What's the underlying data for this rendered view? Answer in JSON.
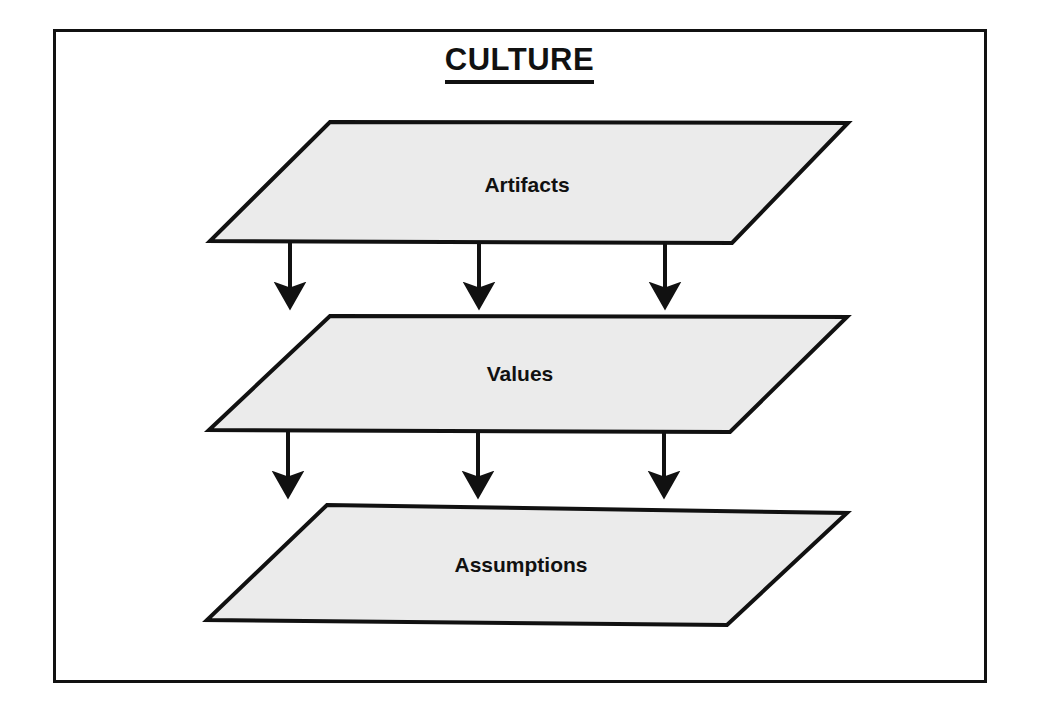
{
  "diagram": {
    "title": "CULTURE",
    "frame": {
      "border_color": "#111111",
      "background_color": "#ffffff"
    },
    "shape_style": {
      "fill_color": "#ebebeb",
      "stroke_color": "#111111",
      "shape": "parallelogram"
    },
    "layers": [
      {
        "label": "Artifacts",
        "order": 1,
        "label_x": 527,
        "label_y": 185,
        "points": "330,122 848,123 732,243 210,241"
      },
      {
        "label": "Values",
        "order": 2,
        "label_x": 520,
        "label_y": 374,
        "points": "330,316 847,317 730,432 209,430"
      },
      {
        "label": "Assumptions",
        "order": 3,
        "label_x": 521,
        "label_y": 565,
        "points": "327,505 847,513 727,625 207,620"
      }
    ],
    "arrow_groups": [
      {
        "from_layer": "Artifacts",
        "to_layer": "Values",
        "direction": "down",
        "count": 3,
        "arrows": [
          {
            "x": 290,
            "y_start": 243,
            "y_end": 303
          },
          {
            "x": 479,
            "y_start": 243,
            "y_end": 303
          },
          {
            "x": 665,
            "y_start": 243,
            "y_end": 303
          }
        ]
      },
      {
        "from_layer": "Values",
        "to_layer": "Assumptions",
        "direction": "down",
        "count": 3,
        "arrows": [
          {
            "x": 288,
            "y_start": 432,
            "y_end": 492
          },
          {
            "x": 478,
            "y_start": 432,
            "y_end": 492
          },
          {
            "x": 664,
            "y_start": 432,
            "y_end": 492
          }
        ]
      }
    ]
  }
}
